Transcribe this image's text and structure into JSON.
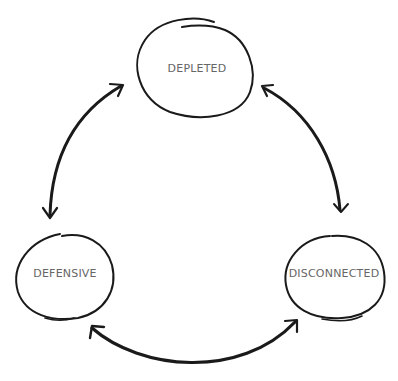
{
  "diagram": {
    "type": "cycle",
    "stroke_color": "#1a1a1a",
    "label_color": "#666666",
    "nodes": [
      {
        "id": "depleted",
        "label": "DEPLETED"
      },
      {
        "id": "defensive",
        "label": "DEFENSIVE"
      },
      {
        "id": "disconnected",
        "label": "DISCONNECTED"
      }
    ],
    "edges": [
      {
        "from": "depleted",
        "to": "defensive",
        "bidirectional": true
      },
      {
        "from": "depleted",
        "to": "disconnected",
        "bidirectional": true
      },
      {
        "from": "defensive",
        "to": "disconnected",
        "bidirectional": true
      }
    ]
  }
}
